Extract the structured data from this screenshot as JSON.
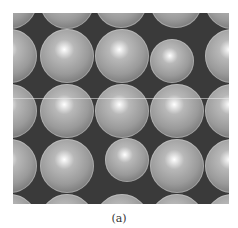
{
  "figure": {
    "caption": "(a)",
    "panel": {
      "x": 13,
      "y": 13,
      "width": 216,
      "height": 191,
      "background": "#3a3a3a"
    },
    "sphere_style": {
      "highlight": "#ffffff",
      "mid": "#b8b8b8",
      "edge": "#6a6a6a",
      "rim": "#d8d8d8"
    },
    "guide_line_y": 85,
    "spheres": [
      {
        "cx": -3,
        "cy": -11,
        "r": 27
      },
      {
        "cx": 54,
        "cy": -11,
        "r": 27
      },
      {
        "cx": 108,
        "cy": -11,
        "r": 26
      },
      {
        "cx": 163,
        "cy": -11,
        "r": 26
      },
      {
        "cx": 219,
        "cy": -11,
        "r": 27
      },
      {
        "cx": -3,
        "cy": 43,
        "r": 27
      },
      {
        "cx": 54,
        "cy": 43,
        "r": 27
      },
      {
        "cx": 109,
        "cy": 43,
        "r": 27
      },
      {
        "cx": 159,
        "cy": 48,
        "r": 22
      },
      {
        "cx": 219,
        "cy": 43,
        "r": 27
      },
      {
        "cx": -3,
        "cy": 98,
        "r": 27
      },
      {
        "cx": 54,
        "cy": 98,
        "r": 27
      },
      {
        "cx": 109,
        "cy": 98,
        "r": 27
      },
      {
        "cx": 164,
        "cy": 98,
        "r": 27
      },
      {
        "cx": 219,
        "cy": 98,
        "r": 27
      },
      {
        "cx": -3,
        "cy": 153,
        "r": 27
      },
      {
        "cx": 54,
        "cy": 153,
        "r": 27
      },
      {
        "cx": 114,
        "cy": 147,
        "r": 22
      },
      {
        "cx": 164,
        "cy": 153,
        "r": 27
      },
      {
        "cx": 219,
        "cy": 153,
        "r": 27
      },
      {
        "cx": -3,
        "cy": 208,
        "r": 27
      },
      {
        "cx": 54,
        "cy": 208,
        "r": 27
      },
      {
        "cx": 109,
        "cy": 208,
        "r": 27
      },
      {
        "cx": 164,
        "cy": 208,
        "r": 27
      },
      {
        "cx": 219,
        "cy": 208,
        "r": 27
      }
    ]
  }
}
